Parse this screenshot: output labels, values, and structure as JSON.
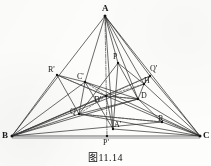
{
  "figure": {
    "caption": "图11.14",
    "stroke_color": "#2b2b2b",
    "background_color": "#fdfdfc",
    "vertices": [
      {
        "id": "A",
        "label": "A",
        "x": 105,
        "y": 16,
        "lx": 102,
        "ly": 4,
        "size": "big",
        "dot": true
      },
      {
        "id": "B",
        "label": "B",
        "x": 12,
        "y": 136,
        "lx": 2,
        "ly": 131,
        "size": "big",
        "dot": true
      },
      {
        "id": "C",
        "label": "C",
        "x": 200,
        "y": 136,
        "lx": 203,
        "ly": 131,
        "size": "big",
        "dot": true
      }
    ],
    "points": [
      {
        "id": "Rp",
        "label": "R'",
        "x": 57,
        "y": 75,
        "lx": 48,
        "ly": 66,
        "dot": true
      },
      {
        "id": "Cp",
        "label": "C'",
        "x": 85,
        "y": 82,
        "lx": 77,
        "ly": 73,
        "dot": true
      },
      {
        "id": "P",
        "label": "P",
        "x": 118,
        "y": 63,
        "lx": 113,
        "ly": 53,
        "dot": true
      },
      {
        "id": "Qp",
        "label": "Q'",
        "x": 150,
        "y": 76,
        "lx": 150,
        "ly": 65,
        "dot": true
      },
      {
        "id": "H",
        "label": "H",
        "x": 144,
        "y": 84,
        "lx": 144,
        "ly": 77,
        "dot": true
      },
      {
        "id": "Dp",
        "label": "D'",
        "x": 106,
        "y": 96,
        "lx": 94,
        "ly": 96,
        "dot": true
      },
      {
        "id": "D",
        "label": "D",
        "x": 138,
        "y": 99,
        "lx": 141,
        "ly": 92,
        "dot": true
      },
      {
        "id": "Q",
        "label": "Q",
        "x": 79,
        "y": 114,
        "lx": 70,
        "ly": 108,
        "dot": true
      },
      {
        "id": "R",
        "label": "R",
        "x": 162,
        "y": 122,
        "lx": 158,
        "ly": 115,
        "dot": true
      },
      {
        "id": "Ap",
        "label": "A'",
        "x": 113,
        "y": 129,
        "lx": 114,
        "ly": 121,
        "dot": true
      },
      {
        "id": "Pp",
        "label": "P'",
        "x": 107,
        "y": 136,
        "lx": 103,
        "ly": 139,
        "dot": true
      }
    ],
    "solid_edges": [
      [
        "A",
        "B"
      ],
      [
        "A",
        "C"
      ],
      [
        "B",
        "C"
      ],
      [
        "A",
        "Cp"
      ],
      [
        "A",
        "P"
      ],
      [
        "A",
        "H"
      ],
      [
        "A",
        "D"
      ],
      [
        "A",
        "Qp"
      ],
      [
        "A",
        "Ap"
      ],
      [
        "B",
        "Rp"
      ],
      [
        "B",
        "Cp"
      ],
      [
        "B",
        "Q"
      ],
      [
        "B",
        "Dp"
      ],
      [
        "B",
        "D"
      ],
      [
        "B",
        "H"
      ],
      [
        "B",
        "Qp"
      ],
      [
        "B",
        "R"
      ],
      [
        "C",
        "H"
      ],
      [
        "C",
        "Qp"
      ],
      [
        "C",
        "D"
      ],
      [
        "C",
        "R"
      ],
      [
        "C",
        "Q"
      ],
      [
        "C",
        "Cp"
      ],
      [
        "C",
        "Rp"
      ],
      [
        "C",
        "Ap"
      ],
      [
        "Rp",
        "Cp"
      ],
      [
        "Cp",
        "D"
      ],
      [
        "Cp",
        "Q"
      ],
      [
        "Q",
        "D"
      ],
      [
        "Q",
        "R"
      ],
      [
        "D",
        "R"
      ],
      [
        "P",
        "Q"
      ],
      [
        "P",
        "Ap"
      ],
      [
        "P",
        "H"
      ],
      [
        "P",
        "D"
      ],
      [
        "Qp",
        "H"
      ],
      [
        "H",
        "D"
      ],
      [
        "Dp",
        "D"
      ],
      [
        "Rp",
        "Q"
      ],
      [
        "Cp",
        "Ap"
      ],
      [
        "Dp",
        "Ap"
      ]
    ],
    "dashed_edges": [
      [
        "B",
        "Dp"
      ],
      [
        "Dp",
        "D"
      ],
      [
        "Dp",
        "Cp"
      ],
      [
        "Dp",
        "H"
      ],
      [
        "Dp",
        "Q"
      ],
      [
        "Rp",
        "Dp"
      ],
      [
        "Dp",
        "Qp"
      ],
      [
        "Q",
        "R"
      ]
    ],
    "dashdot_edges": [
      [
        "A",
        "Pp"
      ]
    ],
    "baseline": {
      "x1": 12,
      "y1": 138,
      "x2": 200,
      "y2": 138
    }
  }
}
